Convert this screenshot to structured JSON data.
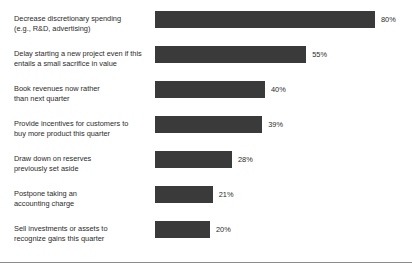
{
  "chart_data": {
    "type": "bar",
    "orientation": "horizontal",
    "title": "",
    "subtitle": "",
    "xlabel": "",
    "ylabel": "",
    "xlim": [
      0,
      100
    ],
    "grid": false,
    "legend": false,
    "value_suffix": "%",
    "bar_color": "#3a3a3a",
    "categories": [
      "Decrease discretionary spending (e.g., R&D, advertising)",
      "Delay starting a new project even if this entails a small sacrifice in value",
      "Book revenues now rather than next quarter",
      "Provide incentives for customers to buy more product this quarter",
      "Draw down on reserves previously set aside",
      "Postpone taking an accounting charge",
      "Sell investments or assets to recognize gains this quarter"
    ],
    "values": [
      80,
      55,
      40,
      39,
      28,
      21,
      20
    ],
    "value_labels": [
      "80%",
      "55%",
      "40%",
      "39%",
      "28%",
      "21%",
      "20%"
    ]
  },
  "rows": [
    {
      "line1": "Decrease discretionary spending",
      "line2": "(e.g., R&D, advertising)",
      "value": 80,
      "value_label": "80%"
    },
    {
      "line1": "Delay starting a new project even if this",
      "line2": "entails a small sacrifice in value",
      "value": 55,
      "value_label": "55%"
    },
    {
      "line1": "Book revenues now rather",
      "line2": "than next quarter",
      "value": 40,
      "value_label": "40%"
    },
    {
      "line1": "Provide incentives for customers to",
      "line2": "buy more product this quarter",
      "value": 39,
      "value_label": "39%"
    },
    {
      "line1": "Draw down on reserves",
      "line2": "previously set aside",
      "value": 28,
      "value_label": "28%"
    },
    {
      "line1": "Postpone taking an",
      "line2": "accounting charge",
      "value": 21,
      "value_label": "21%"
    },
    {
      "line1": "Sell investments or assets to",
      "line2": "recognize gains this quarter",
      "value": 20,
      "value_label": "20%"
    }
  ]
}
